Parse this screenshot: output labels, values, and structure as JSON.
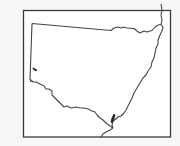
{
  "map": {
    "region": "New South Wales outline",
    "frame_color": "#3a3a3a",
    "border_color": "#444444",
    "fill_color": "#ffffff",
    "background_color": "#f7f7f7",
    "markers": [
      {
        "name": "western-lake-marker",
        "x": 35,
        "y": 69
      },
      {
        "name": "south-coast-lake-marker",
        "x": 112,
        "y": 119
      }
    ]
  }
}
